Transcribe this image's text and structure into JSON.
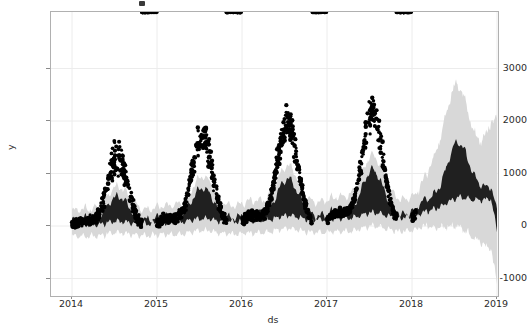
{
  "figure": {
    "background_color": "#ffffff",
    "axes_border_color": "#b0b0b0",
    "grid_color": "#e9e9e9"
  },
  "axis": {
    "xlabel": "ds",
    "ylabel": "y",
    "x_ticks": [
      "2014",
      "2015",
      "2016",
      "2017",
      "2018",
      "2019"
    ],
    "y_ticks": [
      "-1000",
      "0",
      "1000",
      "2000",
      "3000"
    ]
  },
  "colors": {
    "observed_points": "#000000",
    "forecast_band": "#202020",
    "uncertainty_band": "#d8d8d8",
    "grid": "#ececec"
  },
  "chart_data": {
    "type": "area",
    "title": "",
    "xlabel": "ds",
    "ylabel": "y",
    "xlim": [
      "2013-11-20",
      "2019-01-01"
    ],
    "ylim": [
      -1300,
      3850
    ],
    "xtick_values": [
      "2014",
      "2015",
      "2016",
      "2017",
      "2018",
      "2019"
    ],
    "ytick_values": [
      -1000,
      0,
      1000,
      2000,
      3000
    ],
    "grid": true,
    "legend": "none",
    "history_end": "2018-01-20",
    "forecast_end": "2019-01-01",
    "series": [
      {
        "name": "yhat_upper_dark",
        "note": "upper edge of the dark band, in data units",
        "x": [
          "2014-01-01",
          "2014-02-01",
          "2014-03-01",
          "2014-04-01",
          "2014-05-01",
          "2014-06-01",
          "2014-07-01",
          "2014-08-01",
          "2014-09-01",
          "2014-10-01",
          "2014-11-01",
          "2014-12-01",
          "2015-01-01",
          "2015-02-01",
          "2015-03-01",
          "2015-04-01",
          "2015-05-01",
          "2015-06-01",
          "2015-07-01",
          "2015-08-01",
          "2015-09-01",
          "2015-10-01",
          "2015-11-01",
          "2015-12-01",
          "2016-01-01",
          "2016-02-01",
          "2016-03-01",
          "2016-04-01",
          "2016-05-01",
          "2016-06-01",
          "2016-07-01",
          "2016-08-01",
          "2016-09-01",
          "2016-10-01",
          "2016-11-01",
          "2016-12-01",
          "2017-01-01",
          "2017-02-01",
          "2017-03-01",
          "2017-04-01",
          "2017-05-01",
          "2017-06-01",
          "2017-07-01",
          "2017-08-01",
          "2017-09-01",
          "2017-10-01",
          "2017-11-01",
          "2017-12-01",
          "2018-01-01",
          "2018-02-01",
          "2018-03-01",
          "2018-04-01",
          "2018-05-01",
          "2018-06-01",
          "2018-07-01",
          "2018-08-01",
          "2018-09-01",
          "2018-10-01",
          "2018-11-01",
          "2018-12-01",
          "2019-01-01"
        ],
        "values": [
          60,
          180,
          330,
          470,
          600,
          700,
          760,
          720,
          620,
          500,
          400,
          330,
          300,
          430,
          640,
          860,
          1030,
          1140,
          1180,
          1140,
          1020,
          860,
          700,
          580,
          540,
          680,
          900,
          1120,
          1290,
          1390,
          1420,
          1380,
          1250,
          1080,
          920,
          800,
          760,
          900,
          1120,
          1340,
          1510,
          1600,
          1620,
          1560,
          1430,
          1260,
          1100,
          980,
          940,
          1080,
          1300,
          1400,
          1480,
          1550,
          1560,
          1540,
          1520,
          1500,
          1470,
          1400,
          980
        ]
      },
      {
        "name": "yhat_lower_dark",
        "note": "lower edge of the dark band, in data units",
        "x": [
          "2014-01-01",
          "2014-03-01",
          "2014-06-01",
          "2014-09-01",
          "2014-12-01",
          "2015-03-01",
          "2015-06-01",
          "2015-09-01",
          "2015-12-01",
          "2016-03-01",
          "2016-06-01",
          "2016-09-01",
          "2016-12-01",
          "2017-03-01",
          "2017-06-01",
          "2017-09-01",
          "2017-12-01",
          "2018-03-01",
          "2018-06-01",
          "2018-09-01",
          "2018-12-01",
          "2019-01-01"
        ],
        "values": [
          0,
          20,
          60,
          30,
          -20,
          40,
          110,
          60,
          -10,
          70,
          170,
          100,
          20,
          110,
          230,
          150,
          60,
          160,
          330,
          390,
          240,
          -280
        ]
      },
      {
        "name": "uncertainty_upper",
        "note": "light gray outer band upper edge",
        "x": [
          "2014-01-01",
          "2014-07-01",
          "2015-01-01",
          "2015-07-01",
          "2016-01-01",
          "2016-07-01",
          "2017-01-01",
          "2017-07-01",
          "2018-01-01",
          "2018-04-01",
          "2018-07-01",
          "2018-09-01",
          "2018-11-01",
          "2019-01-01"
        ],
        "values": [
          160,
          830,
          380,
          1240,
          620,
          1500,
          840,
          1700,
          1060,
          2100,
          3050,
          3700,
          3600,
          3450
        ]
      },
      {
        "name": "uncertainty_lower",
        "note": "light gray outer band lower edge",
        "x": [
          "2014-01-01",
          "2014-07-01",
          "2015-01-01",
          "2015-07-01",
          "2016-01-01",
          "2016-07-01",
          "2017-01-01",
          "2017-07-01",
          "2018-01-01",
          "2018-04-01",
          "2018-07-01",
          "2018-09-01",
          "2018-11-01",
          "2019-01-01"
        ],
        "values": [
          -180,
          -300,
          -260,
          -180,
          -200,
          -120,
          -180,
          -80,
          -250,
          -150,
          -330,
          -500,
          -760,
          -990
        ]
      },
      {
        "name": "observed_y",
        "note": "scatter point envelope: seasonal peaks of actual observations",
        "peak_years": [
          "2014",
          "2015",
          "2016",
          "2017"
        ],
        "peak_values": [
          1300,
          1680,
          1930,
          2140
        ],
        "trough_values": [
          -30,
          0,
          40,
          80
        ]
      }
    ]
  }
}
